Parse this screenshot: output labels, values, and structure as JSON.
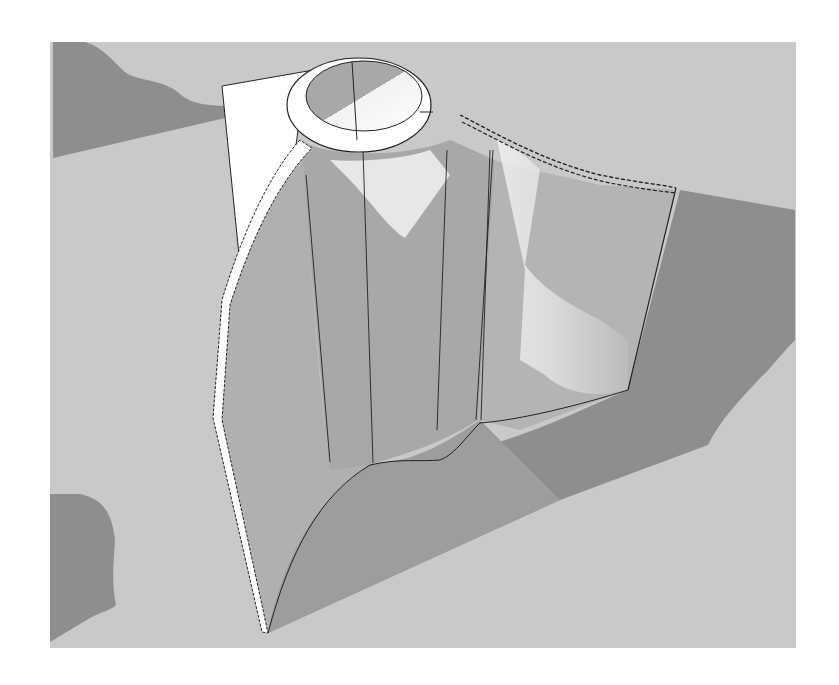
{
  "image": {
    "kind": "3d-render",
    "description": "Grayscale 3D model render: cylindrical pipe with ring rim, swept curved surface fin and vertical slab casting shadows on a ground plane",
    "width": 839,
    "height": 685
  },
  "colors": {
    "page_background": "#ffffff",
    "ground": "#c9c9c9",
    "shadow": "#8e8e8e",
    "surface_mid": "#b3b3b3",
    "surface_dark_face": "#9f9f9f",
    "highlight": "#f4f4f4",
    "white_face": "#ffffff",
    "edge_line": "#222222"
  },
  "ground_plane": {
    "x": 50,
    "y": 42,
    "width": 746,
    "height": 606
  },
  "labels": []
}
